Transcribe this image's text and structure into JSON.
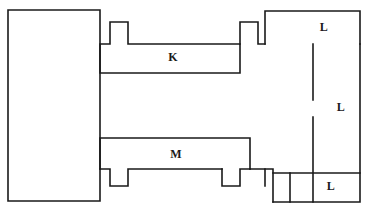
{
  "figure": {
    "kind": "floor-plan-line-drawing",
    "width": 368,
    "height": 214,
    "background_color": "#ffffff",
    "line_color": "#1a1a1a",
    "line_width": 1.6
  },
  "labels": [
    {
      "id": "room-k",
      "text": "K",
      "x": 173,
      "y": 57
    },
    {
      "id": "room-l-top",
      "text": "L",
      "x": 324,
      "y": 27
    },
    {
      "id": "room-l-middle",
      "text": "L",
      "x": 341,
      "y": 107
    },
    {
      "id": "room-m",
      "text": "M",
      "x": 176,
      "y": 154
    },
    {
      "id": "room-l-bottom",
      "text": "L",
      "x": 331,
      "y": 186
    }
  ],
  "shapes": [
    {
      "id": "left-block",
      "name": "left-rectangle",
      "points": "8,10 100,10 100,201 8,201 8,10"
    },
    {
      "id": "room-k-outline",
      "name": "room-k-polyline",
      "points": "100,44 110,44 110,22 128,22 128,44 240,44 240,22 258,22 258,44 265,44"
    },
    {
      "id": "room-k-lower",
      "name": "room-k-lower-wall",
      "points": "100,44 100,73 240,73 240,44"
    },
    {
      "id": "top-right-block",
      "name": "top-right-l-room",
      "points": "265,44 265,11 360,11 360,44 265,44"
    },
    {
      "id": "right-outer-wall",
      "name": "right-outer-wall",
      "points": "360,44 360,202 273,202"
    },
    {
      "id": "mid-partition-upper",
      "name": "middle-partition-upper",
      "points": "313,44 313,100"
    },
    {
      "id": "mid-partition-lower",
      "name": "middle-partition-lower",
      "points": "313,117 313,202"
    },
    {
      "id": "bottom-divider",
      "name": "bottom-l-divider",
      "points": "290,173 290,202"
    },
    {
      "id": "bottom-divider-h",
      "name": "bottom-l-horizontal",
      "points": "273,173 360,173"
    },
    {
      "id": "room-m-outline",
      "name": "room-m-polyline",
      "points": "100,138 250,138 250,169 240,169 240,186 222,186 222,169 128,169 128,186 110,186 110,169 100,169"
    },
    {
      "id": "room-m-left-wall",
      "name": "room-m-left-wall",
      "points": "100,138 100,169"
    },
    {
      "id": "m-right-connector",
      "name": "m-to-bottom-right-connector",
      "points": "250,169 273,169 273,202"
    },
    {
      "id": "mid-right-stub",
      "name": "mid-right-vertical-stub",
      "points": "265,169 265,186"
    }
  ],
  "paths": {
    "left_block": "M 8 10 L 100 10 L 100 201 L 8 201 Z",
    "k_room": "M 100 73 L 100 44 L 110 44 L 110 22 L 128 22 L 128 44 L 240 44 L 240 73 Z",
    "k_right_notch": "M 240 44 L 240 22 L 258 22 L 258 44 L 265 44",
    "top_right_l": "M 265 44 L 265 11 L 360 11 L 360 44",
    "right_wall": "M 360 44 L 360 202 L 273 202",
    "partition_upper": "M 313 44 L 313 100",
    "partition_lower": "M 313 117 L 313 202",
    "bottom_l_top": "M 273 173 L 360 173",
    "bottom_l_div": "M 290 173 L 290 202",
    "m_room": "M 100 169 L 100 138 L 250 138 L 250 169",
    "m_left_notch": "M 100 169 L 110 169 L 110 186 L 128 186 L 128 169 L 222 169",
    "m_right_notch": "M 222 169 L 222 186 L 240 186 L 240 169 L 250 169",
    "m_to_right": "M 250 169 L 265 169 L 265 186",
    "right_stub": "M 265 169 L 273 169 L 273 202"
  }
}
